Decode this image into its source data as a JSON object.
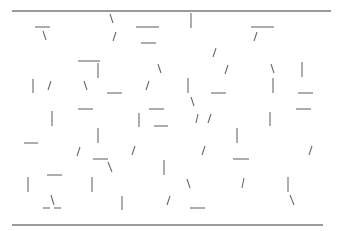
{
  "diagram": {
    "width": 343,
    "height": 231,
    "stroke_color": "#6b6b6b",
    "rule_color": "#7a7a7a",
    "rules": [
      {
        "name": "top-rule",
        "x1": 12,
        "y1": 11,
        "x2": 331,
        "y2": 11
      },
      {
        "name": "bottom-rule",
        "x1": 12,
        "y1": 225,
        "x2": 323,
        "y2": 225
      }
    ],
    "segments": [
      {
        "x1": 35,
        "y1": 27,
        "x2": 50,
        "y2": 27
      },
      {
        "x1": 43,
        "y1": 31,
        "x2": 46,
        "y2": 40
      },
      {
        "x1": 110,
        "y1": 14,
        "x2": 113,
        "y2": 23
      },
      {
        "x1": 116,
        "y1": 32,
        "x2": 113,
        "y2": 41
      },
      {
        "x1": 136,
        "y1": 27,
        "x2": 159,
        "y2": 27
      },
      {
        "x1": 141,
        "y1": 43,
        "x2": 156,
        "y2": 43
      },
      {
        "x1": 191,
        "y1": 13,
        "x2": 191,
        "y2": 28
      },
      {
        "x1": 251,
        "y1": 27,
        "x2": 274,
        "y2": 27
      },
      {
        "x1": 257,
        "y1": 32,
        "x2": 254,
        "y2": 41
      },
      {
        "x1": 78,
        "y1": 61,
        "x2": 100,
        "y2": 61
      },
      {
        "x1": 98,
        "y1": 63,
        "x2": 98,
        "y2": 78
      },
      {
        "x1": 216,
        "y1": 48,
        "x2": 213,
        "y2": 57
      },
      {
        "x1": 33,
        "y1": 79,
        "x2": 33,
        "y2": 93
      },
      {
        "x1": 51,
        "y1": 81,
        "x2": 48,
        "y2": 90
      },
      {
        "x1": 84,
        "y1": 81,
        "x2": 87,
        "y2": 90
      },
      {
        "x1": 107,
        "y1": 93,
        "x2": 122,
        "y2": 93
      },
      {
        "x1": 158,
        "y1": 64,
        "x2": 161,
        "y2": 73
      },
      {
        "x1": 149,
        "y1": 81,
        "x2": 146,
        "y2": 90
      },
      {
        "x1": 188,
        "y1": 78,
        "x2": 188,
        "y2": 93
      },
      {
        "x1": 228,
        "y1": 65,
        "x2": 225,
        "y2": 74
      },
      {
        "x1": 211,
        "y1": 93,
        "x2": 226,
        "y2": 93
      },
      {
        "x1": 271,
        "y1": 64,
        "x2": 274,
        "y2": 73
      },
      {
        "x1": 273,
        "y1": 78,
        "x2": 273,
        "y2": 93
      },
      {
        "x1": 302,
        "y1": 62,
        "x2": 302,
        "y2": 77
      },
      {
        "x1": 298,
        "y1": 93,
        "x2": 313,
        "y2": 93
      },
      {
        "x1": 52,
        "y1": 111,
        "x2": 52,
        "y2": 126
      },
      {
        "x1": 78,
        "y1": 109,
        "x2": 93,
        "y2": 109
      },
      {
        "x1": 149,
        "y1": 109,
        "x2": 164,
        "y2": 109
      },
      {
        "x1": 191,
        "y1": 97,
        "x2": 194,
        "y2": 106
      },
      {
        "x1": 139,
        "y1": 113,
        "x2": 139,
        "y2": 127
      },
      {
        "x1": 154,
        "y1": 126,
        "x2": 168,
        "y2": 126
      },
      {
        "x1": 198,
        "y1": 114,
        "x2": 196,
        "y2": 123
      },
      {
        "x1": 211,
        "y1": 114,
        "x2": 208,
        "y2": 123
      },
      {
        "x1": 270,
        "y1": 112,
        "x2": 270,
        "y2": 126
      },
      {
        "x1": 296,
        "y1": 109,
        "x2": 311,
        "y2": 109
      },
      {
        "x1": 24,
        "y1": 143,
        "x2": 38,
        "y2": 143
      },
      {
        "x1": 98,
        "y1": 128,
        "x2": 98,
        "y2": 143
      },
      {
        "x1": 80,
        "y1": 147,
        "x2": 77,
        "y2": 156
      },
      {
        "x1": 93,
        "y1": 159,
        "x2": 108,
        "y2": 159
      },
      {
        "x1": 108,
        "y1": 162,
        "x2": 112,
        "y2": 172
      },
      {
        "x1": 135,
        "y1": 146,
        "x2": 132,
        "y2": 155
      },
      {
        "x1": 237,
        "y1": 128,
        "x2": 237,
        "y2": 143
      },
      {
        "x1": 205,
        "y1": 146,
        "x2": 202,
        "y2": 155
      },
      {
        "x1": 233,
        "y1": 159,
        "x2": 249,
        "y2": 159
      },
      {
        "x1": 312,
        "y1": 146,
        "x2": 309,
        "y2": 155
      },
      {
        "x1": 164,
        "y1": 160,
        "x2": 164,
        "y2": 175
      },
      {
        "x1": 47,
        "y1": 175,
        "x2": 62,
        "y2": 175
      },
      {
        "x1": 28,
        "y1": 177,
        "x2": 28,
        "y2": 192
      },
      {
        "x1": 92,
        "y1": 177,
        "x2": 92,
        "y2": 192
      },
      {
        "x1": 187,
        "y1": 179,
        "x2": 190,
        "y2": 188
      },
      {
        "x1": 244,
        "y1": 178,
        "x2": 242,
        "y2": 188
      },
      {
        "x1": 288,
        "y1": 177,
        "x2": 288,
        "y2": 192
      },
      {
        "x1": 290,
        "y1": 195,
        "x2": 294,
        "y2": 205
      },
      {
        "x1": 51,
        "y1": 195,
        "x2": 54,
        "y2": 205
      },
      {
        "x1": 43,
        "y1": 208,
        "x2": 50,
        "y2": 208
      },
      {
        "x1": 54,
        "y1": 208,
        "x2": 61,
        "y2": 208
      },
      {
        "x1": 122,
        "y1": 196,
        "x2": 122,
        "y2": 210
      },
      {
        "x1": 170,
        "y1": 196,
        "x2": 167,
        "y2": 205
      },
      {
        "x1": 190,
        "y1": 208,
        "x2": 205,
        "y2": 208
      }
    ]
  }
}
